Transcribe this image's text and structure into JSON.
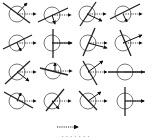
{
  "figure": {
    "colors": {
      "circle": "#777777",
      "line": "#222222",
      "arrow": "#111111",
      "dotted": "#333333"
    },
    "cells": [
      {
        "row": 0,
        "col": 0,
        "cx": 17,
        "cy": 14,
        "line": [
          3,
          3,
          30,
          23
        ],
        "solid": [
          17,
          14,
          27,
          3
        ]
      },
      {
        "row": 0,
        "col": 1,
        "cx": 52,
        "cy": 15,
        "line": [
          38,
          22,
          68,
          8
        ],
        "solid": [
          52,
          15,
          55,
          24
        ]
      },
      {
        "row": 0,
        "col": 2,
        "cx": 87,
        "cy": 14,
        "line": [
          80,
          26,
          96,
          2
        ],
        "solid": [
          87,
          14,
          102,
          21
        ]
      },
      {
        "row": 0,
        "col": 3,
        "cx": 123,
        "cy": 14,
        "line": [
          110,
          19,
          140,
          4
        ],
        "solid": [
          123,
          14,
          127,
          22
        ]
      },
      {
        "row": 1,
        "col": 0,
        "cx": 17,
        "cy": 43,
        "line": [
          3,
          49,
          32,
          35
        ],
        "solid": [
          17,
          43,
          21,
          51
        ]
      },
      {
        "row": 1,
        "col": 1,
        "cx": 52,
        "cy": 43,
        "line": [
          53,
          29,
          53,
          58
        ],
        "solid": [
          52,
          43,
          72,
          43
        ]
      },
      {
        "row": 1,
        "col": 2,
        "cx": 88,
        "cy": 43,
        "line": [
          83,
          56,
          95,
          28
        ],
        "solid": [
          88,
          43,
          107,
          48
        ]
      },
      {
        "row": 1,
        "col": 3,
        "cx": 123,
        "cy": 43,
        "line": [
          120,
          30,
          131,
          56
        ],
        "solid": [
          123,
          43,
          142,
          35
        ]
      },
      {
        "row": 2,
        "col": 0,
        "cx": 17,
        "cy": 72,
        "line": [
          5,
          84,
          30,
          61
        ],
        "solid": [
          17,
          72,
          29,
          81
        ]
      },
      {
        "row": 2,
        "col": 1,
        "cx": 53,
        "cy": 71,
        "line": [
          40,
          68,
          68,
          75
        ],
        "solid": [
          55,
          71,
          55,
          63
        ]
      },
      {
        "row": 2,
        "col": 2,
        "cx": 88,
        "cy": 72,
        "line": [
          83,
          61,
          97,
          85
        ],
        "solid": [
          88,
          72,
          103,
          61
        ]
      },
      {
        "row": 2,
        "col": 3,
        "cx": 125,
        "cy": 72,
        "line": [
          108,
          72,
          145,
          72
        ],
        "solid": null
      },
      {
        "row": 3,
        "col": 0,
        "cx": 17,
        "cy": 101,
        "line": [
          4,
          92,
          33,
          108
        ],
        "solid": [
          17,
          101,
          21,
          93
        ]
      },
      {
        "row": 3,
        "col": 1,
        "cx": 52,
        "cy": 101,
        "line": [
          46,
          111,
          64,
          89
        ],
        "solid": [
          52,
          101,
          59,
          109
        ]
      },
      {
        "row": 3,
        "col": 2,
        "cx": 88,
        "cy": 101,
        "line": [
          79,
          91,
          97,
          110
        ],
        "solid": [
          88,
          101,
          101,
          92
        ]
      },
      {
        "row": 3,
        "col": 3,
        "cx": 125,
        "cy": 101,
        "line": [
          125,
          87,
          125,
          116
        ],
        "solid": [
          125,
          101,
          144,
          101
        ]
      }
    ],
    "legend": {
      "arrow": [
        57,
        127,
        78,
        127
      ],
      "text": "· ·   · ·       · · ·"
    }
  }
}
